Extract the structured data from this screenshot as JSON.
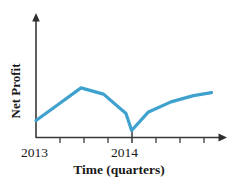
{
  "chart_data": {
    "type": "line",
    "title": "",
    "xlabel": "Time (quarters)",
    "ylabel": "Net Profit",
    "grid": false,
    "legend": null,
    "axis_style": "arrow-tipped axes, no numeric scale on y-axis",
    "x_tick_labels": [
      "2013",
      "2014"
    ],
    "x_tick_label_positions": [
      0,
      4
    ],
    "x_tick_count": 9,
    "xlim": [
      0,
      8
    ],
    "ylim": [
      0,
      10
    ],
    "series": [
      {
        "name": "Net Profit",
        "color": "#3FA2CE",
        "x": [
          0,
          1,
          2,
          3,
          4,
          4.25,
          5,
          6,
          7,
          7.8
        ],
        "values": [
          2.2,
          4.3,
          6.4,
          5.6,
          3.1,
          0.9,
          3.3,
          4.6,
          5.4,
          5.8
        ],
        "quarter_labels": [
          "2013 Q1",
          "2013 Q2",
          "2013 Q3",
          "2013 Q4",
          "2014 Q1",
          "2014 Q1b",
          "2014 Q2",
          "2014 Q3",
          "2014 Q4",
          "2015 Q1"
        ]
      }
    ],
    "annotations": []
  },
  "colors": {
    "line": "#3FA2CE",
    "axis": "#3a3a3a",
    "text": "#1a1a1a",
    "background": "#ffffff"
  }
}
